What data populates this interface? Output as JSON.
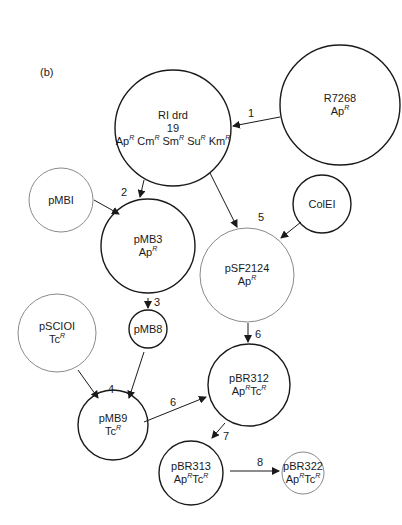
{
  "panel_label": "(b)",
  "nodes": [
    {
      "id": "R1drd19",
      "name": "RI drd",
      "sub": "19",
      "markers": [
        "Ap",
        "Cm",
        "Sm",
        "Su",
        "Km"
      ],
      "cx": 173,
      "cy": 128,
      "r": 58,
      "stroke": "#1a1a1a"
    },
    {
      "id": "R7268",
      "name": "R7268",
      "markers": [
        "Ap"
      ],
      "cx": 340,
      "cy": 105,
      "r": 60,
      "stroke": "#1a1a1a"
    },
    {
      "id": "pMBI",
      "name": "pMBI",
      "markers": [],
      "cx": 61,
      "cy": 200,
      "r": 32,
      "stroke": "#8a8a8a"
    },
    {
      "id": "pMB3",
      "name": "pMB3",
      "markers": [
        "Ap"
      ],
      "cx": 148,
      "cy": 246,
      "r": 47,
      "stroke": "#1a1a1a"
    },
    {
      "id": "ColEI",
      "name": "ColEI",
      "markers": [],
      "cx": 322,
      "cy": 204,
      "r": 29,
      "stroke": "#1a1a1a"
    },
    {
      "id": "pSF2124",
      "name": "pSF2124",
      "markers": [
        "Ap"
      ],
      "cx": 247,
      "cy": 275,
      "r": 47,
      "stroke": "#8a8a8a"
    },
    {
      "id": "pMB8",
      "name": "pMB8",
      "markers": [],
      "cx": 148,
      "cy": 329,
      "r": 19,
      "stroke": "#1a1a1a"
    },
    {
      "id": "pSCIOI",
      "name": "pSCIOI",
      "markers": [
        "Tc"
      ],
      "cx": 57,
      "cy": 333,
      "r": 39,
      "stroke": "#8a8a8a"
    },
    {
      "id": "pMB9",
      "name": "pMB9",
      "markers": [
        "Tc"
      ],
      "cx": 113,
      "cy": 425,
      "r": 35,
      "stroke": "#1a1a1a"
    },
    {
      "id": "pBR312",
      "name": "pBR312",
      "markers": [
        "Ap",
        "Tc"
      ],
      "cx": 249,
      "cy": 385,
      "r": 41,
      "stroke": "#1a1a1a"
    },
    {
      "id": "pBR313",
      "name": "pBR313",
      "markers": [
        "Ap",
        "Tc"
      ],
      "cx": 191,
      "cy": 473,
      "r": 32,
      "stroke": "#1a1a1a"
    },
    {
      "id": "pBR322",
      "name": "pBR322",
      "markers": [
        "Ap",
        "Tc"
      ],
      "cx": 303,
      "cy": 473,
      "r": 21,
      "stroke": "#8a8a8a"
    }
  ],
  "resistance_superscript": "R",
  "edges": [
    {
      "from": "R7268",
      "to": "R1drd19",
      "step": "1",
      "x1": 280,
      "y1": 117,
      "x2": 233,
      "y2": 126,
      "lx": 251,
      "ly": 113
    },
    {
      "from": "pMBI",
      "to": "pMB3",
      "step": "2",
      "x1": 94,
      "y1": 200,
      "x2": 119,
      "y2": 214,
      "lx": 124,
      "ly": 192
    },
    {
      "from": "R1drd19",
      "to": "pMB3",
      "step": "",
      "x1": 144,
      "y1": 180,
      "x2": 140,
      "y2": 197,
      "lx": 0,
      "ly": 0
    },
    {
      "from": "R1drd19",
      "to": "pSF2124",
      "step": "5",
      "x1": 210,
      "y1": 173,
      "x2": 237,
      "y2": 227,
      "lx": 261,
      "ly": 217
    },
    {
      "from": "ColEI",
      "to": "pSF2124",
      "step": "",
      "x1": 301,
      "y1": 222,
      "x2": 281,
      "y2": 238,
      "lx": 0,
      "ly": 0
    },
    {
      "from": "pMB3",
      "to": "pMB8",
      "step": "3",
      "x1": 148,
      "y1": 298,
      "x2": 148,
      "y2": 308,
      "lx": 157,
      "ly": 302
    },
    {
      "from": "pSF2124",
      "to": "pBR312",
      "step": "6",
      "x1": 248,
      "y1": 323,
      "x2": 248,
      "y2": 342,
      "lx": 258,
      "ly": 334
    },
    {
      "from": "pSCIOI",
      "to": "pMB9",
      "step": "4",
      "x1": 78,
      "y1": 370,
      "x2": 98,
      "y2": 398,
      "lx": 111,
      "ly": 389
    },
    {
      "from": "pMB8",
      "to": "pMB9",
      "step": "",
      "x1": 144,
      "y1": 352,
      "x2": 129,
      "y2": 398,
      "lx": 0,
      "ly": 0
    },
    {
      "from": "pMB9",
      "to": "pBR312",
      "step": "6",
      "x1": 144,
      "y1": 422,
      "x2": 206,
      "y2": 397,
      "lx": 173,
      "ly": 402
    },
    {
      "from": "pBR312",
      "to": "pBR313",
      "step": "7",
      "x1": 225,
      "y1": 423,
      "x2": 212,
      "y2": 438,
      "lx": 226,
      "ly": 436
    },
    {
      "from": "pBR313",
      "to": "pBR322",
      "step": "8",
      "x1": 230,
      "y1": 471,
      "x2": 279,
      "y2": 471,
      "lx": 260,
      "ly": 462
    }
  ],
  "caption": "Fig. 3 (b) ... The evolution of plasmid pBR322 ... (partially cut off)"
}
